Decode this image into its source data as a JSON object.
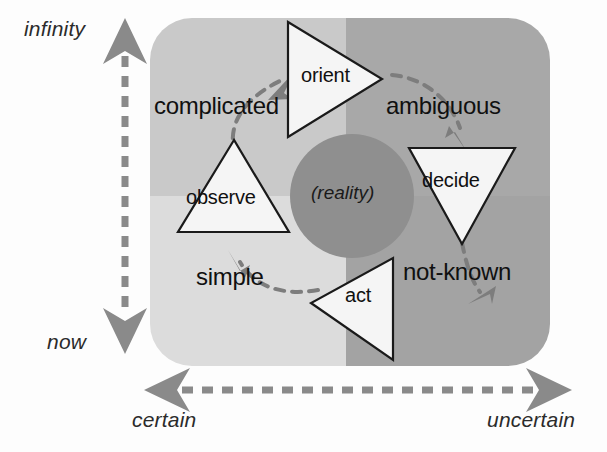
{
  "diagram": {
    "colors": {
      "quadrant_top_left": "#c9c9c9",
      "quadrant_top_right": "#a8a8a8",
      "quadrant_bottom_left": "#dcdcdc",
      "quadrant_bottom_right": "#a3a3a3",
      "center_circle": "#8f8f8f",
      "triangle_fill": "#f5f5f5",
      "triangle_stroke": "#1a1a1a",
      "arrow_gray": "#7d7d7d",
      "axis_gray": "#8a8a8a",
      "text_dark": "#101010",
      "background": "#fdfdfd"
    },
    "axes": {
      "vertical": {
        "name": "time-axis",
        "top_label": "infinity",
        "bottom_label": "now",
        "style": "dashed double-headed arrow"
      },
      "horizontal": {
        "name": "certainty-axis",
        "left_label": "certain",
        "right_label": "uncertain",
        "style": "dashed double-headed arrow"
      }
    },
    "center": {
      "label": "(reality)"
    },
    "nodes": [
      {
        "id": "orient",
        "label": "orient",
        "direction": "right"
      },
      {
        "id": "decide",
        "label": "decide",
        "direction": "down"
      },
      {
        "id": "act",
        "label": "act",
        "direction": "left"
      },
      {
        "id": "observe",
        "label": "observe",
        "direction": "up"
      }
    ],
    "transitions": [
      {
        "id": "complicated",
        "label": "complicated",
        "from": "observe",
        "to": "orient"
      },
      {
        "id": "ambiguous",
        "label": "ambiguous",
        "from": "orient",
        "to": "decide"
      },
      {
        "id": "not-known",
        "label": "not-known",
        "from": "decide",
        "to": "act"
      },
      {
        "id": "simple",
        "label": "simple",
        "from": "act",
        "to": "observe"
      }
    ]
  }
}
